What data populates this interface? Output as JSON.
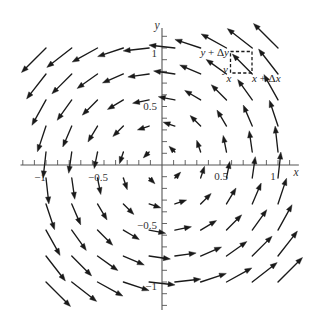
{
  "axes": {
    "x_label": "x",
    "y_label": "y",
    "x_range": [
      -1.22,
      1.18
    ],
    "y_range": [
      -1.24,
      1.17
    ],
    "x_tick_range": [
      -1.2,
      1.1
    ],
    "y_tick_range": [
      -1.2,
      1.1
    ],
    "minor_tick_step": 0.1,
    "x_tick_labels": [
      {
        "value": -1,
        "label": "−1"
      },
      {
        "value": -0.5,
        "label": "−0.5"
      },
      {
        "value": 0.5,
        "label": "0.5"
      },
      {
        "value": 1,
        "label": "1"
      }
    ],
    "y_tick_labels": [
      {
        "value": 1,
        "label": "1"
      },
      {
        "value": 0.5,
        "label": "0.5"
      },
      {
        "value": -0.5,
        "label": "−0.5"
      },
      {
        "value": -1,
        "label": "−1"
      }
    ]
  },
  "circulation_box": {
    "corner_x": 0.58,
    "corner_y": 0.78,
    "top_left_label": [
      "y",
      " + Δ",
      "y"
    ],
    "bottom_left_y_label": "y",
    "bottom_left_x_label": "x",
    "bottom_right_label": [
      "x",
      " + Δ",
      "x"
    ]
  },
  "vector_field": {
    "description": "rotational field, arrows counterclockwise about origin",
    "arrow_color": "#1a1a1a",
    "grid": [
      -1,
      -0.778,
      -0.556,
      -0.333,
      -0.111,
      0.111,
      0.333,
      0.556,
      0.778,
      1
    ],
    "arrows": [
      [
        -1,
        1,
        -1,
        -1
      ],
      [
        -0.778,
        1,
        -1,
        -0.778
      ],
      [
        -0.556,
        1,
        -1,
        -0.556
      ],
      [
        -0.333,
        1,
        -1,
        -0.333
      ],
      [
        -0.111,
        1,
        -1,
        -0.111
      ],
      [
        0.111,
        1,
        -1,
        0.111
      ],
      [
        0.333,
        1,
        -1,
        0.333
      ],
      [
        0.556,
        1,
        -1,
        0.556
      ],
      [
        0.778,
        1,
        -1,
        0.778
      ],
      [
        1,
        1,
        -1,
        1
      ],
      [
        -1,
        0.778,
        -0.778,
        -1
      ],
      [
        -0.778,
        0.778,
        -0.778,
        -0.778
      ],
      [
        -0.556,
        0.778,
        -0.778,
        -0.556
      ],
      [
        -0.333,
        0.778,
        -0.778,
        -0.333
      ],
      [
        -0.111,
        0.778,
        -0.778,
        -0.111
      ],
      [
        0.111,
        0.778,
        -0.778,
        0.111
      ],
      [
        0.333,
        0.778,
        -0.778,
        0.333
      ],
      [
        0.556,
        0.778,
        -0.778,
        0.556
      ],
      [
        0.778,
        0.778,
        -0.778,
        0.778
      ],
      [
        1,
        0.778,
        -0.778,
        1
      ],
      [
        -1,
        0.556,
        -0.556,
        -1
      ],
      [
        -0.778,
        0.556,
        -0.556,
        -0.778
      ],
      [
        -0.556,
        0.556,
        -0.556,
        -0.556
      ],
      [
        -0.333,
        0.556,
        -0.556,
        -0.333
      ],
      [
        -0.111,
        0.556,
        -0.556,
        -0.111
      ],
      [
        0.111,
        0.556,
        -0.556,
        0.111
      ],
      [
        0.333,
        0.556,
        -0.556,
        0.333
      ],
      [
        0.556,
        0.556,
        -0.556,
        0.556
      ],
      [
        0.778,
        0.556,
        -0.556,
        0.778
      ],
      [
        1,
        0.556,
        -0.556,
        1
      ],
      [
        -1,
        0.333,
        -0.333,
        -1
      ],
      [
        -0.778,
        0.333,
        -0.333,
        -0.778
      ],
      [
        -0.556,
        0.333,
        -0.333,
        -0.556
      ],
      [
        -0.333,
        0.333,
        -0.333,
        -0.333
      ],
      [
        -0.111,
        0.333,
        -0.333,
        -0.111
      ],
      [
        0.111,
        0.333,
        -0.333,
        0.111
      ],
      [
        0.333,
        0.333,
        -0.333,
        0.333
      ],
      [
        0.556,
        0.333,
        -0.333,
        0.556
      ],
      [
        0.778,
        0.333,
        -0.333,
        0.778
      ],
      [
        1,
        0.333,
        -0.333,
        1
      ],
      [
        -1,
        0.111,
        -0.111,
        -1
      ],
      [
        -0.778,
        0.111,
        -0.111,
        -0.778
      ],
      [
        -0.556,
        0.111,
        -0.111,
        -0.556
      ],
      [
        -0.333,
        0.111,
        -0.111,
        -0.333
      ],
      [
        -0.111,
        0.111,
        -0.111,
        -0.111
      ],
      [
        0.111,
        0.111,
        -0.111,
        0.111
      ],
      [
        0.333,
        0.111,
        -0.111,
        0.333
      ],
      [
        0.556,
        0.111,
        -0.111,
        0.556
      ],
      [
        0.778,
        0.111,
        -0.111,
        0.778
      ],
      [
        1,
        0.111,
        -0.111,
        1
      ],
      [
        -1,
        -0.111,
        0.111,
        -1
      ],
      [
        -0.778,
        -0.111,
        0.111,
        -0.778
      ],
      [
        -0.556,
        -0.111,
        0.111,
        -0.556
      ],
      [
        -0.333,
        -0.111,
        0.111,
        -0.333
      ],
      [
        -0.111,
        -0.111,
        0.111,
        -0.111
      ],
      [
        0.111,
        -0.111,
        0.111,
        0.111
      ],
      [
        0.333,
        -0.111,
        0.111,
        0.333
      ],
      [
        0.556,
        -0.111,
        0.111,
        0.556
      ],
      [
        0.778,
        -0.111,
        0.111,
        0.778
      ],
      [
        1,
        -0.111,
        0.111,
        1
      ],
      [
        -1,
        -0.333,
        0.333,
        -1
      ],
      [
        -0.778,
        -0.333,
        0.333,
        -0.778
      ],
      [
        -0.556,
        -0.333,
        0.333,
        -0.556
      ],
      [
        -0.333,
        -0.333,
        0.333,
        -0.333
      ],
      [
        -0.111,
        -0.333,
        0.333,
        -0.111
      ],
      [
        0.111,
        -0.333,
        0.333,
        0.111
      ],
      [
        0.333,
        -0.333,
        0.333,
        0.333
      ],
      [
        0.556,
        -0.333,
        0.333,
        0.556
      ],
      [
        0.778,
        -0.333,
        0.333,
        0.778
      ],
      [
        1,
        -0.333,
        0.333,
        1
      ],
      [
        -1,
        -0.556,
        0.556,
        -1
      ],
      [
        -0.778,
        -0.556,
        0.556,
        -0.778
      ],
      [
        -0.556,
        -0.556,
        0.556,
        -0.556
      ],
      [
        -0.333,
        -0.556,
        0.556,
        -0.333
      ],
      [
        -0.111,
        -0.556,
        0.556,
        -0.111
      ],
      [
        0.111,
        -0.556,
        0.556,
        0.111
      ],
      [
        0.333,
        -0.556,
        0.556,
        0.333
      ],
      [
        0.556,
        -0.556,
        0.556,
        0.556
      ],
      [
        0.778,
        -0.556,
        0.556,
        0.778
      ],
      [
        1,
        -0.556,
        0.556,
        1
      ],
      [
        -1,
        -0.778,
        0.778,
        -1
      ],
      [
        -0.778,
        -0.778,
        0.778,
        -0.778
      ],
      [
        -0.556,
        -0.778,
        0.778,
        -0.556
      ],
      [
        -0.333,
        -0.778,
        0.778,
        -0.333
      ],
      [
        -0.111,
        -0.778,
        0.778,
        -0.111
      ],
      [
        0.111,
        -0.778,
        0.778,
        0.111
      ],
      [
        0.333,
        -0.778,
        0.778,
        0.333
      ],
      [
        0.556,
        -0.778,
        0.778,
        0.556
      ],
      [
        0.778,
        -0.778,
        0.778,
        0.778
      ],
      [
        1,
        -0.778,
        0.778,
        1
      ],
      [
        -1,
        -1,
        1,
        -1
      ],
      [
        -0.778,
        -1,
        1,
        -0.778
      ],
      [
        -0.556,
        -1,
        1,
        -0.556
      ],
      [
        -0.333,
        -1,
        1,
        -0.333
      ],
      [
        -0.111,
        -1,
        1,
        -0.111
      ],
      [
        0.111,
        -1,
        1,
        0.111
      ],
      [
        0.333,
        -1,
        1,
        0.333
      ],
      [
        0.556,
        -1,
        1,
        0.556
      ],
      [
        0.778,
        -1,
        1,
        0.778
      ],
      [
        1,
        -1,
        1,
        1
      ]
    ]
  }
}
